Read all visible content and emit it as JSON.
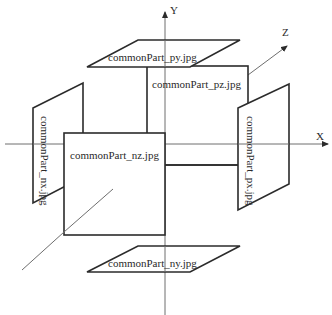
{
  "diagram": {
    "axes": {
      "x": {
        "label": "X"
      },
      "y": {
        "label": "Y"
      },
      "z": {
        "label": "Z"
      }
    },
    "faces": {
      "py": {
        "label": "commonPart_py.jpg"
      },
      "pz": {
        "label": "commonPart_pz.jpg"
      },
      "nx": {
        "label": "commonPart_nx.jpg"
      },
      "nz": {
        "label": "commonPart_nz.jpg"
      },
      "px": {
        "label": "commonPart_px.jpg"
      },
      "ny": {
        "label": "commonPart_ny.jpg"
      }
    },
    "colors": {
      "edge": "#2b2b2b",
      "axis": "#6e6e6e",
      "text": "#2a2a2a",
      "background": "#ffffff"
    }
  }
}
